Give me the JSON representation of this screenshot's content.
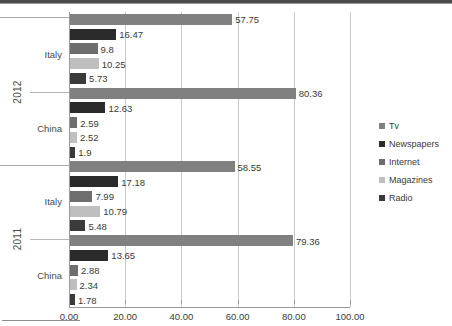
{
  "chart_data": {
    "type": "bar",
    "orientation": "horizontal",
    "title": "",
    "xlabel": "",
    "ylabel": "",
    "xlim": [
      0,
      100
    ],
    "xticks": [
      "0.00",
      "20.00",
      "40.00",
      "60.00",
      "80.00",
      "100.00"
    ],
    "xtick_values": [
      0,
      20,
      40,
      60,
      80,
      100
    ],
    "grid": true,
    "legend_position": "right",
    "series": [
      {
        "name": "Tv",
        "color": "#808080"
      },
      {
        "name": "Newspapers",
        "color": "#2b2b2b"
      },
      {
        "name": "Internet",
        "color": "#6e6e6e"
      },
      {
        "name": "Magazines",
        "color": "#bfbfbf"
      },
      {
        "name": "Radio",
        "color": "#3a3a3a"
      }
    ],
    "groups": [
      {
        "year": "2012",
        "countries": [
          {
            "name": "Italy",
            "values": [
              57.75,
              16.47,
              9.8,
              10.25,
              5.73
            ],
            "labels": [
              "57.75",
              "16.47",
              "9.8",
              "10.25",
              "5.73"
            ]
          },
          {
            "name": "China",
            "values": [
              80.36,
              12.63,
              2.59,
              2.52,
              1.9
            ],
            "labels": [
              "80.36",
              "12.63",
              "2.59",
              "2.52",
              "1.9"
            ]
          }
        ]
      },
      {
        "year": "2011",
        "countries": [
          {
            "name": "Italy",
            "values": [
              58.55,
              17.18,
              7.99,
              10.79,
              5.48
            ],
            "labels": [
              "58.55",
              "17.18",
              "7.99",
              "10.79",
              "5.48"
            ]
          },
          {
            "name": "China",
            "values": [
              79.36,
              13.65,
              2.88,
              2.34,
              1.78
            ],
            "labels": [
              "79.36",
              "13.65",
              "2.88",
              "2.34",
              "1.78"
            ]
          }
        ]
      }
    ]
  },
  "legend": {
    "items": [
      {
        "label": "Tv",
        "color": "#808080"
      },
      {
        "label": "Newspapers",
        "color": "#2b2b2b"
      },
      {
        "label": "Internet",
        "color": "#6e6e6e"
      },
      {
        "label": "Magazines",
        "color": "#bfbfbf"
      },
      {
        "label": "Radio",
        "color": "#3a3a3a"
      }
    ]
  }
}
